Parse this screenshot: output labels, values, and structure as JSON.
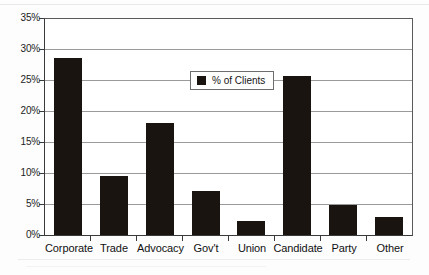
{
  "chart_data": {
    "type": "bar",
    "title": "",
    "subtitle": "",
    "xlabel": "",
    "ylabel": "",
    "categories": [
      "Corporate",
      "Trade",
      "Advocacy",
      "Gov't",
      "Union",
      "Candidate",
      "Party",
      "Other"
    ],
    "values": [
      28.7,
      9.6,
      18.2,
      7.1,
      2.3,
      25.8,
      4.9,
      3.0
    ],
    "series": [
      {
        "name": "% of Clients",
        "values": [
          28.7,
          9.6,
          18.2,
          7.1,
          2.3,
          25.8,
          4.9,
          3.0
        ]
      }
    ],
    "ylim": [
      0,
      35
    ],
    "ytick_values": [
      0,
      5,
      10,
      15,
      20,
      25,
      30,
      35
    ],
    "ytick_labels": [
      "0%",
      "5%",
      "10%",
      "15%",
      "20%",
      "25%",
      "30%",
      "35%"
    ],
    "grid": true,
    "grid_axis": "y",
    "legend": {
      "position": "inside-upper-center",
      "entries": [
        {
          "label": "% of Clients",
          "color": "#1a1410",
          "marker": "square"
        }
      ]
    },
    "colors": {
      "bar": "#1a1410",
      "gridline": "#9a9a9a",
      "axis": "#3a3a3a",
      "plot_background": "#ffffff",
      "figure_background": "#fdfdfd",
      "text": "#111111"
    }
  },
  "legend": {
    "label": "% of Clients",
    "swatch_name": "legend-swatch-black-square"
  }
}
